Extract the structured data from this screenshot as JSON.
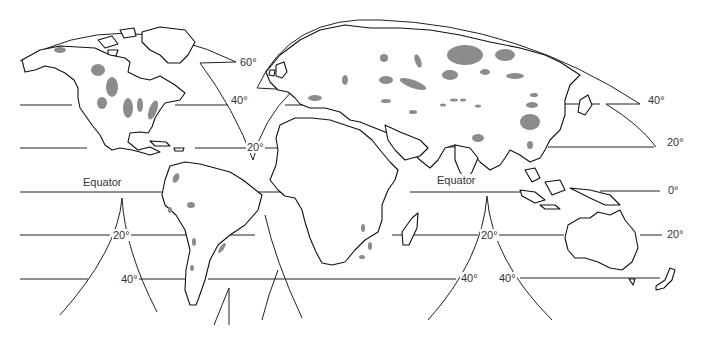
{
  "map": {
    "title": "",
    "projection": "interrupted world map",
    "colors": {
      "land_outline": "#111111",
      "highlighted_region": "#8c8c8c",
      "background": "#ffffff"
    },
    "latitude_labels": {
      "equator_left": "Equator",
      "equator_right": "Equator",
      "zero_right": "0°",
      "n60_center": "60°",
      "n40_center": "40°",
      "n20_center": "20°",
      "n40_right": "40°",
      "n20_right": "20°",
      "s20_left": "20°",
      "s40_left": "40°",
      "s20_center": "20°",
      "s40_center_left": "40°",
      "s40_center_right": "40°",
      "s20_right": "20°"
    },
    "continents": [
      "North America",
      "South America",
      "Europe",
      "Africa",
      "Asia",
      "Australia",
      "New Zealand",
      "Greenland",
      "Madagascar"
    ]
  }
}
